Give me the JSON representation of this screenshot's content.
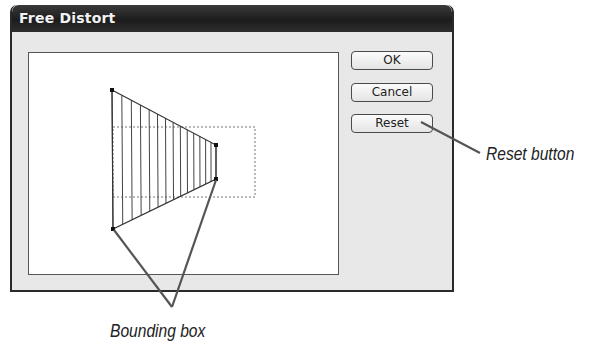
{
  "dialog": {
    "title": "Free Distort",
    "buttons": {
      "ok": "OK",
      "cancel": "Cancel",
      "reset": "Reset"
    }
  },
  "preview": {
    "bounding_box": {
      "x": 113,
      "y": 127,
      "width": 142,
      "height": 70,
      "style": "dashed"
    },
    "handles": [
      {
        "name": "top-left",
        "x": 112,
        "y": 90
      },
      {
        "name": "top-right",
        "x": 216,
        "y": 145
      },
      {
        "name": "bottom-right",
        "x": 216,
        "y": 179
      },
      {
        "name": "bottom-left",
        "x": 113,
        "y": 229
      }
    ],
    "stripe_count": 15
  },
  "callouts": {
    "reset": "Reset button",
    "bounding": "Bounding box"
  },
  "colors": {
    "titlebar": "#1c1c1c",
    "dialog_bg": "#e8e8e8",
    "preview_bg": "#ffffff",
    "callout_line": "#555555"
  }
}
